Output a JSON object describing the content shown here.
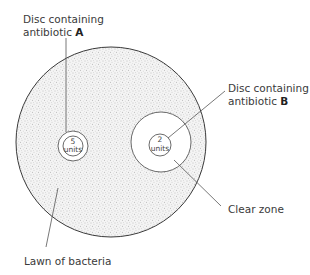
{
  "diagram": {
    "type": "antibiotic-sensitivity-plate",
    "labels": {
      "disc_a": {
        "line1": "Disc containing",
        "line2_prefix": "antibiotic ",
        "letter": "A"
      },
      "disc_b": {
        "line1": "Disc containing",
        "line2_prefix": "antibiotic ",
        "letter": "B"
      },
      "clear_zone": "Clear zone",
      "lawn": "Lawn of bacteria"
    },
    "discs": [
      {
        "id": "A",
        "dose": "5",
        "unit": "units"
      },
      {
        "id": "B",
        "dose": "2",
        "unit": "units"
      }
    ],
    "colors": {
      "outline": "#3a3a3a",
      "stipple": "#9a9a9a",
      "background": "#ffffff"
    }
  }
}
